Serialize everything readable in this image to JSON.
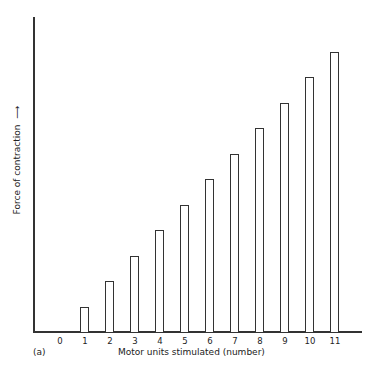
{
  "chart_data": {
    "type": "bar",
    "title": "",
    "panel_label": "(a)",
    "xlabel": "Motor units stimulated (number)",
    "ylabel": "Force of contraction",
    "ylabel_arrow": "⟶",
    "categories": [
      "0",
      "1",
      "2",
      "3",
      "4",
      "5",
      "6",
      "7",
      "8",
      "9",
      "10",
      "11"
    ],
    "values": [
      0,
      1,
      2,
      3,
      4,
      5,
      6,
      7,
      8,
      9,
      10,
      11
    ],
    "ylim": [
      0,
      11.2
    ],
    "y_ticks_shown": false,
    "grid": false,
    "legend": null,
    "bar_style": "outlined, white fill"
  }
}
